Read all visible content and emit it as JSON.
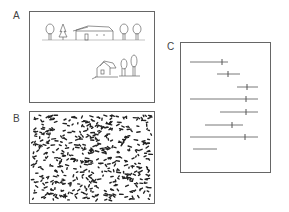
{
  "figure": {
    "panels": [
      {
        "id": "A",
        "label": "A",
        "description": "line sketch of a street scene: trees and a house along a horizon line, and a smaller house with trees below"
      },
      {
        "id": "B",
        "label": "B",
        "description": "dense texture of scattered dark short strokes"
      },
      {
        "id": "C",
        "label": "C",
        "description": "horizontal line segments of varying length, several with a short vertical tick mark"
      }
    ],
    "panel_c_segments": [
      {
        "x1": 190,
        "x2": 228,
        "y": 62,
        "tick": 222
      },
      {
        "x1": 217,
        "x2": 240,
        "y": 74,
        "tick": 228
      },
      {
        "x1": 237,
        "x2": 258,
        "y": 87,
        "tick": 247
      },
      {
        "x1": 190,
        "x2": 258,
        "y": 99,
        "tick": 246
      },
      {
        "x1": 220,
        "x2": 258,
        "y": 112,
        "tick": 246
      },
      {
        "x1": 205,
        "x2": 243,
        "y": 125,
        "tick": 232
      },
      {
        "x1": 190,
        "x2": 258,
        "y": 137,
        "tick": 245
      },
      {
        "x1": 193,
        "x2": 217,
        "y": 149,
        "tick": null
      }
    ],
    "colors": {
      "border": "#666666",
      "stroke": "#555555",
      "texture": "#222222"
    }
  }
}
